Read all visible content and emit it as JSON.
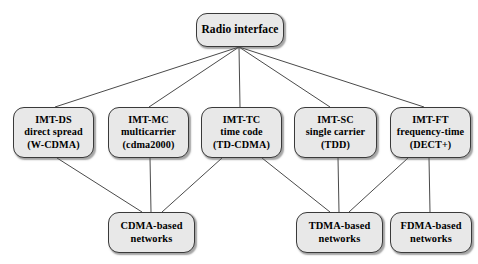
{
  "figure": {
    "root": {
      "id": "radio-interface",
      "lines": [
        "Radio interface"
      ],
      "x": 196,
      "y": 13,
      "w": 88,
      "h": 34
    },
    "middle_nodes": [
      {
        "id": "imt-ds",
        "lines": [
          "IMT-DS",
          "direct spread",
          "(W-CDMA)"
        ],
        "x": 13,
        "y": 107,
        "w": 81,
        "h": 51
      },
      {
        "id": "imt-mc",
        "lines": [
          "IMT-MC",
          "multicarrier",
          "(cdma2000)"
        ],
        "x": 108,
        "y": 107,
        "w": 81,
        "h": 51
      },
      {
        "id": "imt-tc",
        "lines": [
          "IMT-TC",
          "time code",
          "(TD-CDMA)"
        ],
        "x": 201,
        "y": 107,
        "w": 81,
        "h": 51
      },
      {
        "id": "imt-sc",
        "lines": [
          "IMT-SC",
          "single carrier",
          "(TDD)"
        ],
        "x": 294,
        "y": 107,
        "w": 83,
        "h": 51
      },
      {
        "id": "imt-ft",
        "lines": [
          "IMT-FT",
          "frequency-time",
          "(DECT+)"
        ],
        "x": 390,
        "y": 107,
        "w": 81,
        "h": 51
      }
    ],
    "leaf_nodes": [
      {
        "id": "cdma-based-networks",
        "lines": [
          "CDMA-based",
          "networks"
        ],
        "x": 108,
        "y": 212,
        "w": 87,
        "h": 41
      },
      {
        "id": "tdma-based-networks",
        "lines": [
          "TDMA-based",
          "networks"
        ],
        "x": 296,
        "y": 212,
        "w": 87,
        "h": 41
      },
      {
        "id": "fdma-based-networks",
        "lines": [
          "FDMA-based",
          "networks"
        ],
        "x": 390,
        "y": 212,
        "w": 82,
        "h": 41
      }
    ],
    "edges": [
      {
        "from": "radio-interface",
        "to": "imt-ds",
        "x1": 239,
        "y1": 47,
        "x2": 55,
        "y2": 107
      },
      {
        "from": "radio-interface",
        "to": "imt-mc",
        "x1": 239,
        "y1": 47,
        "x2": 149,
        "y2": 107
      },
      {
        "from": "radio-interface",
        "to": "imt-tc",
        "x1": 239,
        "y1": 47,
        "x2": 240,
        "y2": 107
      },
      {
        "from": "radio-interface",
        "to": "imt-sc",
        "x1": 239,
        "y1": 47,
        "x2": 330,
        "y2": 107
      },
      {
        "from": "radio-interface",
        "to": "imt-ft",
        "x1": 239,
        "y1": 47,
        "x2": 424,
        "y2": 107
      },
      {
        "from": "imt-ds",
        "to": "cdma-based-networks",
        "x1": 57,
        "y1": 158,
        "x2": 142,
        "y2": 212
      },
      {
        "from": "imt-mc",
        "to": "cdma-based-networks",
        "x1": 150,
        "y1": 158,
        "x2": 151,
        "y2": 212
      },
      {
        "from": "imt-tc",
        "to": "cdma-based-networks",
        "x1": 222,
        "y1": 158,
        "x2": 162,
        "y2": 212
      },
      {
        "from": "imt-tc",
        "to": "tdma-based-networks",
        "x1": 262,
        "y1": 158,
        "x2": 330,
        "y2": 212
      },
      {
        "from": "imt-sc",
        "to": "tdma-based-networks",
        "x1": 338,
        "y1": 158,
        "x2": 339,
        "y2": 212
      },
      {
        "from": "imt-ft",
        "to": "tdma-based-networks",
        "x1": 408,
        "y1": 158,
        "x2": 349,
        "y2": 212
      },
      {
        "from": "imt-ft",
        "to": "fdma-based-networks",
        "x1": 429,
        "y1": 158,
        "x2": 430,
        "y2": 212
      }
    ],
    "style": {
      "edge_color": "#4a4a4a",
      "node_fill": "#e8e8e8",
      "node_border": "#3a3a3a",
      "background": "#ffffff"
    }
  }
}
